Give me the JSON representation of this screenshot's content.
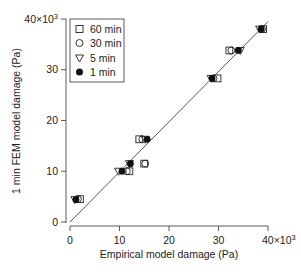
{
  "chart_data": {
    "type": "scatter",
    "title": "",
    "xlabel": "Empirical model damage (Pa)",
    "ylabel": "1 min FEM model damage (Pa)",
    "xlim": [
      0,
      40000
    ],
    "ylim": [
      0,
      40000
    ],
    "x_ticks": [
      "0",
      "10",
      "20",
      "30",
      "40×10³"
    ],
    "y_ticks": [
      "0",
      "10",
      "20",
      "30",
      "40×10³"
    ],
    "x_tick_values": [
      0,
      10,
      20,
      30,
      40
    ],
    "y_tick_values": [
      0,
      10,
      20,
      30,
      40
    ],
    "scale_note": "×10³",
    "grid": false,
    "legend_position": "upper-left",
    "fit_line": {
      "x": [
        0,
        40
      ],
      "y": [
        0,
        39.5
      ]
    },
    "series": [
      {
        "name": "60 min",
        "marker": "open-square",
        "points": [
          [
            2.0,
            4.5
          ],
          [
            12.0,
            10.0
          ],
          [
            15.0,
            11.5
          ],
          [
            14.0,
            16.3
          ],
          [
            29.8,
            28.3
          ],
          [
            32.2,
            33.8
          ],
          [
            39.0,
            38.0
          ]
        ]
      },
      {
        "name": "30 min",
        "marker": "open-circle",
        "points": [
          [
            1.6,
            4.5
          ],
          [
            11.5,
            10.0
          ],
          [
            15.2,
            11.5
          ],
          [
            14.6,
            16.3
          ],
          [
            29.0,
            28.3
          ],
          [
            32.6,
            33.8
          ],
          [
            38.8,
            38.0
          ]
        ]
      },
      {
        "name": "5 min",
        "marker": "open-triangle-down",
        "points": [
          [
            1.0,
            4.4
          ],
          [
            9.8,
            10.0
          ],
          [
            12.0,
            11.5
          ],
          [
            15.2,
            16.3
          ],
          [
            28.5,
            28.3
          ],
          [
            34.4,
            33.8
          ],
          [
            38.3,
            38.0
          ]
        ]
      },
      {
        "name": "1 min",
        "marker": "filled-circle",
        "points": [
          [
            1.2,
            4.4
          ],
          [
            10.5,
            10.0
          ],
          [
            12.2,
            11.5
          ],
          [
            15.6,
            16.3
          ],
          [
            28.7,
            28.3
          ],
          [
            34.0,
            33.8
          ],
          [
            38.6,
            38.0
          ]
        ]
      }
    ]
  },
  "legend": {
    "items": [
      {
        "label": "60 min"
      },
      {
        "label": "30 min"
      },
      {
        "label": "5 min"
      },
      {
        "label": "1 min"
      }
    ]
  }
}
